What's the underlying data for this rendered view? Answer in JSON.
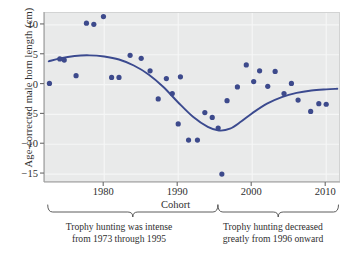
{
  "chart_data": {
    "type": "scatter",
    "title": "",
    "xlabel": "Cohort",
    "ylabel": "Age-corrected male horn length (cm)",
    "xlim": [
      1972,
      2012
    ],
    "ylim": [
      -16.5,
      12.0
    ],
    "grid": true,
    "legend": null,
    "x_ticks": [
      1980,
      1990,
      2000,
      2010
    ],
    "x_tick_labels": [
      "1980",
      "1990",
      "2000",
      "2010"
    ],
    "y_ticks": [
      10,
      5,
      0,
      -5,
      -10,
      -15
    ],
    "y_tick_labels": [
      "10",
      "5",
      "0",
      "−5",
      "−10",
      "−15"
    ],
    "point_color": "#3d4a8c",
    "curve_color": "#3b4a8f",
    "panel_color": "#e9eaea",
    "grid_color": "#f5f6f6",
    "points": [
      {
        "x": 1972.6,
        "y": 0.2
      },
      {
        "x": 1974.0,
        "y": 4.3
      },
      {
        "x": 1974.6,
        "y": 4.1
      },
      {
        "x": 1976.2,
        "y": 1.5
      },
      {
        "x": 1977.6,
        "y": 10.3
      },
      {
        "x": 1978.6,
        "y": 10.1
      },
      {
        "x": 1979.9,
        "y": 11.4
      },
      {
        "x": 1981.0,
        "y": 1.2
      },
      {
        "x": 1982.0,
        "y": 1.2
      },
      {
        "x": 1983.5,
        "y": 4.9
      },
      {
        "x": 1985.0,
        "y": 4.4
      },
      {
        "x": 1986.2,
        "y": 2.3
      },
      {
        "x": 1987.3,
        "y": -2.4
      },
      {
        "x": 1988.4,
        "y": 1.0
      },
      {
        "x": 1989.2,
        "y": -1.5
      },
      {
        "x": 1990.3,
        "y": 1.3
      },
      {
        "x": 1990.0,
        "y": -6.6
      },
      {
        "x": 1991.4,
        "y": -9.3
      },
      {
        "x": 1992.6,
        "y": -9.3
      },
      {
        "x": 1993.6,
        "y": -4.7
      },
      {
        "x": 1994.6,
        "y": -5.5
      },
      {
        "x": 1995.4,
        "y": -7.3
      },
      {
        "x": 1995.9,
        "y": -15.0
      },
      {
        "x": 1996.6,
        "y": -2.7
      },
      {
        "x": 1998.0,
        "y": -0.4
      },
      {
        "x": 1999.2,
        "y": 3.3
      },
      {
        "x": 2000.2,
        "y": 0.5
      },
      {
        "x": 2001.0,
        "y": 2.3
      },
      {
        "x": 2002.1,
        "y": -0.3
      },
      {
        "x": 2003.1,
        "y": 2.2
      },
      {
        "x": 2004.3,
        "y": -1.5
      },
      {
        "x": 2005.3,
        "y": 0.2
      },
      {
        "x": 2006.2,
        "y": -2.6
      },
      {
        "x": 2007.9,
        "y": -4.5
      },
      {
        "x": 2009.0,
        "y": -3.2
      },
      {
        "x": 2010.0,
        "y": -3.3
      }
    ],
    "trend_curve": [
      {
        "x": 1972.5,
        "y": 3.9
      },
      {
        "x": 1974.0,
        "y": 4.4
      },
      {
        "x": 1976.0,
        "y": 4.8
      },
      {
        "x": 1978.0,
        "y": 4.9
      },
      {
        "x": 1980.0,
        "y": 4.7
      },
      {
        "x": 1982.0,
        "y": 4.2
      },
      {
        "x": 1984.0,
        "y": 3.2
      },
      {
        "x": 1986.0,
        "y": 1.7
      },
      {
        "x": 1988.0,
        "y": -0.4
      },
      {
        "x": 1990.0,
        "y": -3.0
      },
      {
        "x": 1992.0,
        "y": -5.4
      },
      {
        "x": 1994.0,
        "y": -7.1
      },
      {
        "x": 1995.5,
        "y": -7.7
      },
      {
        "x": 1997.0,
        "y": -7.4
      },
      {
        "x": 1998.5,
        "y": -6.2
      },
      {
        "x": 2000.0,
        "y": -4.8
      },
      {
        "x": 2002.0,
        "y": -3.2
      },
      {
        "x": 2004.0,
        "y": -2.1
      },
      {
        "x": 2006.0,
        "y": -1.4
      },
      {
        "x": 2008.0,
        "y": -1.0
      },
      {
        "x": 2010.0,
        "y": -0.8
      },
      {
        "x": 2011.5,
        "y": -0.7
      }
    ],
    "annotations": [
      {
        "id": "left",
        "text": "Trophy hunting was intense\nfrom 1973 through 1995",
        "line1": "Trophy hunting was intense",
        "line2": "from 1973 through 1995",
        "span": [
          1972.5,
          1995.5
        ]
      },
      {
        "id": "right",
        "text": "Trophy hunting decreased\ngreatly from 1996 onward",
        "line1": "Trophy hunting decreased",
        "line2": "greatly from 1996 onward",
        "span": [
          1995.5,
          2011.8
        ]
      }
    ]
  }
}
